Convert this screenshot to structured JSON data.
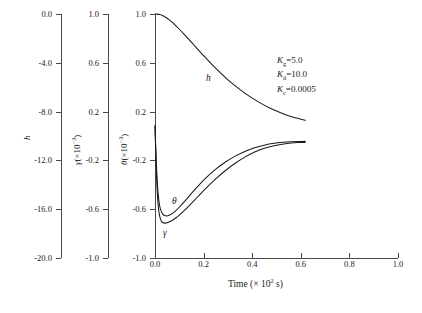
{
  "chart_data": {
    "type": "line",
    "title": "",
    "xlabel": "Time (× 10² s)",
    "xlabel_text": "Time (",
    "xlabel_mult": "× 10",
    "xlabel_exp": "2",
    "xlabel_tail": " s)",
    "xlim": [
      0.0,
      1.0
    ],
    "xticks": [
      "0.0",
      "0.2",
      "0.4",
      "0.6",
      "0.8",
      "1.0"
    ],
    "xtick_values": [
      0.0,
      0.2,
      0.4,
      0.6,
      0.8,
      1.0
    ],
    "grid": false,
    "legend": "none",
    "axes": [
      {
        "id": "h-axis",
        "label": "h",
        "label_base": "h",
        "label_has_mult": false,
        "ylim": [
          -20.0,
          0.0
        ],
        "ticks": [
          "0.0",
          "-4.0",
          "-8.0",
          "-12.0",
          "-16.0",
          "-20.0"
        ],
        "tick_values": [
          0.0,
          -4.0,
          -8.0,
          -12.0,
          -16.0,
          -20.0
        ]
      },
      {
        "id": "gamma-axis",
        "label": "γ(×10⁻³)",
        "label_base": "γ",
        "label_mult": "(×10",
        "label_exp": "−3",
        "label_tail": ")",
        "label_has_mult": true,
        "ylim": [
          -1.0,
          1.0
        ],
        "ticks": [
          "1.0",
          "0.6",
          "0.2",
          "-0.2",
          "-0.6",
          "-1.0"
        ],
        "tick_values": [
          1.0,
          0.6,
          0.2,
          -0.2,
          -0.6,
          -1.0
        ]
      },
      {
        "id": "theta-axis",
        "label": "θ(×10⁻³)",
        "label_base": "θ",
        "label_mult": "(×10",
        "label_exp": "−3",
        "label_tail": ")",
        "label_has_mult": true,
        "ylim": [
          -1.0,
          1.0
        ],
        "ticks": [
          "1.0",
          "0.6",
          "0.2",
          "-0.2",
          "-0.6",
          "-1.0"
        ],
        "tick_values": [
          1.0,
          0.6,
          0.2,
          -0.2,
          -0.6,
          -1.0
        ]
      }
    ],
    "series": [
      {
        "name": "h",
        "label": "h",
        "axis": "theta-axis",
        "x": [
          0.0,
          0.01,
          0.02,
          0.03,
          0.04,
          0.05,
          0.06,
          0.07,
          0.08,
          0.1,
          0.12,
          0.14,
          0.16,
          0.18,
          0.2,
          0.23,
          0.26,
          0.29,
          0.32,
          0.35,
          0.38,
          0.41,
          0.44,
          0.47,
          0.5,
          0.53,
          0.56,
          0.59,
          0.62
        ],
        "y": [
          1.0,
          0.999,
          0.995,
          0.988,
          0.978,
          0.965,
          0.95,
          0.933,
          0.915,
          0.875,
          0.833,
          0.79,
          0.746,
          0.702,
          0.659,
          0.595,
          0.535,
          0.479,
          0.427,
          0.38,
          0.337,
          0.298,
          0.263,
          0.232,
          0.205,
          0.181,
          0.16,
          0.143,
          0.128
        ]
      },
      {
        "name": "theta",
        "label": "θ",
        "axis": "theta-axis",
        "x": [
          0.0,
          0.002,
          0.004,
          0.006,
          0.009,
          0.012,
          0.016,
          0.02,
          0.026,
          0.032,
          0.04,
          0.05,
          0.06,
          0.072,
          0.085,
          0.1,
          0.12,
          0.145,
          0.175,
          0.21,
          0.25,
          0.29,
          0.33,
          0.37,
          0.41,
          0.45,
          0.49,
          0.53,
          0.56,
          0.59,
          0.62
        ],
        "y": [
          0.08,
          -0.03,
          -0.14,
          -0.24,
          -0.36,
          -0.45,
          -0.53,
          -0.58,
          -0.62,
          -0.64,
          -0.652,
          -0.655,
          -0.648,
          -0.634,
          -0.613,
          -0.584,
          -0.54,
          -0.482,
          -0.415,
          -0.343,
          -0.272,
          -0.213,
          -0.165,
          -0.127,
          -0.097,
          -0.075,
          -0.06,
          -0.051,
          -0.047,
          -0.045,
          -0.044
        ]
      },
      {
        "name": "gamma",
        "label": "γ",
        "axis": "theta-axis",
        "x": [
          0.0,
          0.002,
          0.004,
          0.006,
          0.009,
          0.012,
          0.016,
          0.02,
          0.026,
          0.032,
          0.04,
          0.05,
          0.06,
          0.072,
          0.085,
          0.1,
          0.12,
          0.145,
          0.175,
          0.21,
          0.25,
          0.29,
          0.33,
          0.37,
          0.41,
          0.45,
          0.49,
          0.53,
          0.56,
          0.59,
          0.62
        ],
        "y": [
          0.09,
          -0.06,
          -0.2,
          -0.32,
          -0.45,
          -0.54,
          -0.62,
          -0.663,
          -0.696,
          -0.709,
          -0.714,
          -0.712,
          -0.703,
          -0.69,
          -0.672,
          -0.648,
          -0.612,
          -0.562,
          -0.5,
          -0.428,
          -0.352,
          -0.283,
          -0.223,
          -0.173,
          -0.132,
          -0.101,
          -0.079,
          -0.065,
          -0.058,
          -0.054,
          -0.052
        ]
      }
    ],
    "annotations": [
      {
        "symbol": "K",
        "sub": "g",
        "eq": "=",
        "value": "5.0",
        "text": "Kg=5.0"
      },
      {
        "symbol": "K",
        "sub": "d",
        "eq": "=",
        "value": "10.0",
        "text": "Kd=10.0"
      },
      {
        "symbol": "K",
        "sub": "c",
        "eq": "=",
        "value": "0.0005",
        "text": "Kc=0.0005"
      }
    ],
    "colors": {
      "curve": "#1a1a1a",
      "axis": "#4a4a4a",
      "background": "#ffffff"
    }
  }
}
